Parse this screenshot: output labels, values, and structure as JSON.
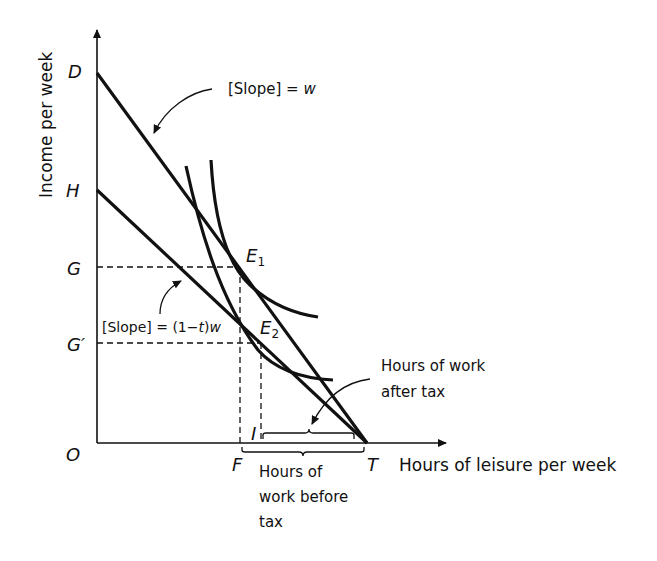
{
  "diagram": {
    "axes": {
      "y_label": "Income per week",
      "x_label": "Hours of leisure per week",
      "origin": "O"
    },
    "y_points": {
      "D": "D",
      "H": "H",
      "G": "G",
      "G_prime": "G′"
    },
    "x_points": {
      "F": "F",
      "I": "I",
      "T": "T"
    },
    "equilibria": {
      "E1_main": "E",
      "E1_sub": "1",
      "E2_main": "E",
      "E2_sub": "2"
    },
    "annotations": {
      "slope_pre_tax": "[Slope] = w",
      "slope_pre_tax_prefix": "[Slope] = ",
      "slope_pre_tax_var": "w",
      "slope_post_tax_prefix": "[Slope] = (1−",
      "slope_post_tax_t": "t",
      "slope_post_tax_mid": ")",
      "slope_post_tax_w": "w",
      "hours_after_tax_line1": "Hours of work",
      "hours_after_tax_line2": "after tax",
      "hours_before_tax_line1": "Hours of",
      "hours_before_tax_line2": "work before",
      "hours_before_tax_line3": "tax"
    },
    "lines": [
      {
        "name": "pre-tax budget line DT",
        "from": "D",
        "to": "T"
      },
      {
        "name": "post-tax budget line HT",
        "from": "H",
        "to": "T"
      }
    ],
    "curves": [
      {
        "name": "indifference curve through E1"
      },
      {
        "name": "indifference curve through E2"
      }
    ],
    "colors": {
      "ink": "#111111",
      "background": "#ffffff"
    }
  }
}
